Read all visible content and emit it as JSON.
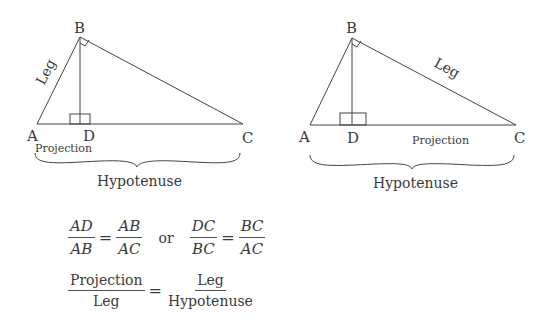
{
  "left_figure": {
    "vertices": {
      "A": "A",
      "B": "B",
      "C": "C",
      "D": "D"
    },
    "leg_label": "Leg",
    "projection_label": "Projection",
    "hypotenuse_label": "Hypotenuse"
  },
  "right_figure": {
    "vertices": {
      "A": "A",
      "B": "B",
      "C": "C",
      "D": "D"
    },
    "leg_label": "Leg",
    "projection_label": "Projection",
    "hypotenuse_label": "Hypotenuse"
  },
  "equations": {
    "row1": {
      "left": {
        "num1": "AD",
        "den1": "AB",
        "num2": "AB",
        "den2": "AC"
      },
      "connector": "or",
      "right": {
        "num1": "DC",
        "den1": "BC",
        "num2": "BC",
        "den2": "AC"
      },
      "equals": "="
    },
    "row2": {
      "num1": "Projection",
      "den1": "Leg",
      "num2": "Leg",
      "den2": "Hypotenuse",
      "equals": "="
    }
  },
  "colors": {
    "stroke": "#444444",
    "text": "#3a3a3a",
    "background": "#ffffff"
  }
}
